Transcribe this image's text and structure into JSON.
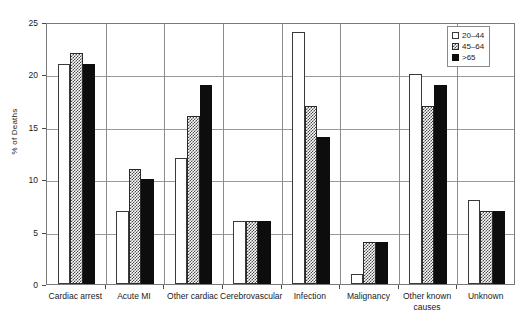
{
  "chart_data": {
    "type": "bar",
    "title": "",
    "xlabel": "",
    "ylabel": "% of Deaths",
    "ylim": [
      0,
      25
    ],
    "yticks": [
      0,
      5,
      10,
      15,
      20,
      25
    ],
    "grid": true,
    "legend_position": "top-right",
    "categories": [
      "Cardiac arrest",
      "Acute MI",
      "Other cardiac",
      "Cerebrovascular",
      "Infection",
      "Malignancy",
      "Other known causes",
      "Unknown"
    ],
    "series": [
      {
        "name": "20–44",
        "pattern": "open",
        "values": [
          21,
          7,
          12,
          6,
          24,
          1,
          20,
          8
        ]
      },
      {
        "name": "45–64",
        "pattern": "checkerboard",
        "values": [
          22,
          11,
          16,
          6,
          17,
          4,
          17,
          7
        ]
      },
      {
        "name": ">65",
        "pattern": "solid-black",
        "values": [
          21,
          10,
          19,
          6,
          14,
          4,
          19,
          7
        ]
      }
    ]
  },
  "legend": {
    "items": [
      {
        "label": "20–44"
      },
      {
        "label": "45–64"
      },
      {
        "label": ">65"
      }
    ]
  },
  "colors": {
    "series_open": "#ffffff",
    "series_hatch": "#4a4a4a",
    "series_solid": "#0d0d0d",
    "axis": "#7a7a7a",
    "grid": "#9a9a9a",
    "text": "#1a1a1a",
    "background": "#ffffff"
  }
}
